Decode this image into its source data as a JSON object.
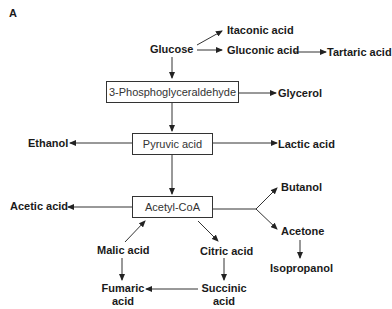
{
  "panel_label": "A",
  "nodes": {
    "glucose": "Glucose",
    "itaconic": "Itaconic acid",
    "gluconic": "Gluconic acid",
    "tartaric": "Tartaric acid",
    "pga": "3-Phosphoglyceraldehyde",
    "glycerol": "Glycerol",
    "pyruvic": "Pyruvic acid",
    "ethanol": "Ethanol",
    "lactic": "Lactic acid",
    "acetylcoa": "Acetyl-CoA",
    "acetic": "Acetic acid",
    "butanol": "Butanol",
    "acetone": "Acetone",
    "isopropanol": "Isopropanol",
    "malic": "Malic acid",
    "citric": "Citric acid",
    "fumaric_1": "Fumaric",
    "fumaric_2": "acid",
    "succinic_1": "Succinic",
    "succinic_2": "acid"
  },
  "edges": [
    [
      "Glucose",
      "Itaconic acid"
    ],
    [
      "Glucose",
      "Gluconic acid"
    ],
    [
      "Gluconic acid",
      "Tartaric acid"
    ],
    [
      "Glucose",
      "3-Phosphoglyceraldehyde"
    ],
    [
      "3-Phosphoglyceraldehyde",
      "Glycerol"
    ],
    [
      "3-Phosphoglyceraldehyde",
      "Pyruvic acid"
    ],
    [
      "Pyruvic acid",
      "Ethanol"
    ],
    [
      "Pyruvic acid",
      "Lactic acid"
    ],
    [
      "Pyruvic acid",
      "Acetyl-CoA"
    ],
    [
      "Acetyl-CoA",
      "Acetic acid"
    ],
    [
      "Acetyl-CoA",
      "Butanol"
    ],
    [
      "Acetyl-CoA",
      "Acetone"
    ],
    [
      "Acetone",
      "Isopropanol"
    ],
    [
      "Acetyl-CoA",
      "Citric acid"
    ],
    [
      "Citric acid",
      "Succinic acid"
    ],
    [
      "Succinic acid",
      "Fumaric acid"
    ],
    [
      "Fumaric acid",
      "Malic acid"
    ],
    [
      "Malic acid",
      "Acetyl-CoA"
    ]
  ]
}
